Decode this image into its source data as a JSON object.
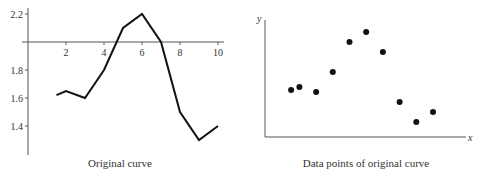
{
  "chart_data": [
    {
      "type": "line",
      "title": "Original curve",
      "xlabel": "",
      "ylabel": "",
      "x": [
        1.5,
        2,
        3,
        4,
        5,
        6,
        7,
        8,
        9,
        10
      ],
      "values": [
        1.62,
        1.65,
        1.6,
        1.8,
        2.1,
        2.2,
        2.0,
        1.5,
        1.3,
        1.4
      ],
      "x_ticks": [
        "2",
        "4",
        "6",
        "8",
        "10"
      ],
      "y_ticks": [
        "2.2",
        "1.8",
        "1.6",
        "1.4"
      ],
      "x_axis_crosses_y": 2.0,
      "xlim": [
        0,
        10.5
      ],
      "ylim": [
        1.2,
        2.25
      ],
      "grid": false
    },
    {
      "type": "scatter",
      "title": "Data points of original curve",
      "xlabel": "x",
      "ylabel": "y",
      "x": [
        1.5,
        2,
        3,
        4,
        5,
        6,
        7,
        8,
        9,
        10
      ],
      "values": [
        1.62,
        1.65,
        1.6,
        1.8,
        2.1,
        2.2,
        2.0,
        1.5,
        1.3,
        1.4
      ],
      "grid": false
    }
  ],
  "captions": {
    "left": "Original curve",
    "right": "Data points of original curve"
  },
  "axis_labels": {
    "right_x": "x",
    "right_y": "y"
  },
  "colors": {
    "line": "#111111",
    "axis": "#555555"
  }
}
